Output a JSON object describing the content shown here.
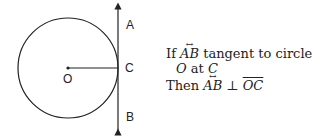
{
  "diagram": {
    "labels": {
      "A": "A",
      "B": "B",
      "C": "C",
      "O": "O"
    },
    "stroke_color": "#222222"
  },
  "statement": {
    "line1_prefix": "If ",
    "line1_vec": "AB",
    "line1_suffix": " tangent to circle",
    "line2_O": "O",
    "line2_at": " at ",
    "line2_C": "C",
    "line3_prefix": "Then ",
    "line3_vec": "AB",
    "line3_perp": " ⊥ ",
    "line3_seg": "OC"
  }
}
